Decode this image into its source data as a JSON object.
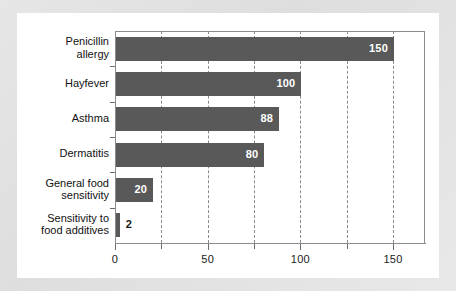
{
  "chart_data": {
    "type": "bar",
    "orientation": "horizontal",
    "title": "",
    "xlabel": "",
    "ylabel": "",
    "categories": [
      "Penicillin allergy",
      "Hayfever",
      "Asthma",
      "Dermatitis",
      "General food sensitivity",
      "Sensitivity to food additives"
    ],
    "category_lines": [
      [
        "Penicillin",
        "allergy"
      ],
      [
        "Hayfever"
      ],
      [
        "Asthma"
      ],
      [
        "Dermatitis"
      ],
      [
        "General food",
        "sensitivity"
      ],
      [
        "Sensitivity to",
        "food additives"
      ]
    ],
    "values": [
      150,
      100,
      88,
      80,
      20,
      2
    ],
    "value_labels": [
      "150",
      "100",
      "88",
      "80",
      "20",
      "2"
    ],
    "value_label_inside": [
      true,
      true,
      true,
      true,
      true,
      false
    ],
    "xlim": [
      0,
      167
    ],
    "xticks_major": [
      0,
      50,
      100,
      150
    ],
    "xtick_labels": [
      "0",
      "50",
      "100",
      "150"
    ],
    "xticks_minor": [
      25,
      75,
      125
    ],
    "gridlines": [
      25,
      50,
      75,
      100,
      125,
      150
    ],
    "grid": true,
    "grid_style": "dashed",
    "legend": false,
    "bar_color": "#595959",
    "value_label_color_inside": "#ffffff",
    "value_label_color_outside": "#1a1a1a",
    "axis_color": "#8c8c8c",
    "grid_color": "#8a8a8a",
    "plot_background": "#ffffff",
    "page_background": "#e4e4e4"
  }
}
